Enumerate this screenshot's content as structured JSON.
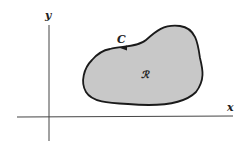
{
  "diagram": {
    "type": "closed-curve-region",
    "axes": {
      "x_label": "x",
      "y_label": "y"
    },
    "curve_label": "C",
    "region_label": "ℛ",
    "orientation": "counterclockwise",
    "colors": {
      "region_fill": "#c8c8c8",
      "curve_stroke": "#1a1a1a",
      "axis_stroke": "#444444",
      "background": "#ffffff"
    }
  }
}
